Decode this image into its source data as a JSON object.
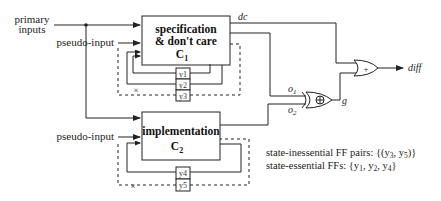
{
  "inputs": {
    "primary_inputs_line1": "primary",
    "primary_inputs_line2": "inputs",
    "pseudo_input_c1": "pseudo-input",
    "pseudo_input_c2": "pseudo-input"
  },
  "blocks": {
    "c1": {
      "line1": "specification",
      "line2": "& don't care",
      "name": "C",
      "subscript": "1"
    },
    "c2": {
      "line1": "implementation",
      "name": "C",
      "subscript": "2"
    }
  },
  "registers": {
    "c1": [
      "y1",
      "y2",
      "y3"
    ],
    "c2": [
      "y4",
      "y5"
    ]
  },
  "signals": {
    "dc": "dc",
    "o1": "o",
    "o1_sub": "1",
    "o2": "o",
    "o2_sub": "2",
    "g": "g",
    "diff": "diff"
  },
  "gates": {
    "xor_symbol": "⊕",
    "or_symbol": "+"
  },
  "broken_marker": "×",
  "legend": {
    "inessential_label": "state-inessential FF pairs: {(y",
    "inessential_sub1": "3",
    "inessential_mid": ", y",
    "inessential_sub2": "5",
    "inessential_end": ")}",
    "essential_label": "state-essential FFs: {y",
    "essential_sub1": "1",
    "essential_mid1": ", y",
    "essential_sub2": "2",
    "essential_mid2": ", y",
    "essential_sub3": "4",
    "essential_end": "}"
  },
  "colors": {
    "line": "#222222",
    "background": "#ffffff"
  }
}
